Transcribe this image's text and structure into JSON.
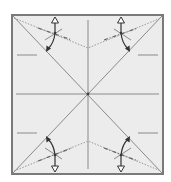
{
  "diagram": {
    "type": "origami-crease-pattern",
    "title": "",
    "paper": {
      "shape": "square",
      "fill": "#ececec",
      "border": "#7a7a7a",
      "x": 12,
      "y": 15,
      "width": 151,
      "height": 159
    },
    "center": {
      "x": 88,
      "y": 94
    },
    "creases": {
      "diagonals": 2,
      "center_lines": [
        "horizontal",
        "vertical"
      ],
      "color": "#8a8a8a"
    },
    "side_marks": [
      {
        "side": "left",
        "y": 55
      },
      {
        "side": "left",
        "y": 133
      },
      {
        "side": "right",
        "y": 55
      },
      {
        "side": "right",
        "y": 133
      }
    ],
    "corner_folds": [
      {
        "corner": "top-left",
        "pivot": {
          "x": 55,
          "y": 33
        },
        "hollow_arrow": "up",
        "solid_arrow": "down-left"
      },
      {
        "corner": "top-right",
        "pivot": {
          "x": 121,
          "y": 33
        },
        "hollow_arrow": "up",
        "solid_arrow": "down-right"
      },
      {
        "corner": "bottom-left",
        "pivot": {
          "x": 55,
          "y": 155
        },
        "hollow_arrow": "down",
        "solid_arrow": "up-left"
      },
      {
        "corner": "bottom-right",
        "pivot": {
          "x": 121,
          "y": 155
        },
        "hollow_arrow": "down",
        "solid_arrow": "up-right"
      }
    ],
    "line_styles": {
      "crease": "#8a8a8a",
      "valley_fold": "dotted",
      "mountain_fold": "dash-dot",
      "arrow": "#333333"
    }
  }
}
